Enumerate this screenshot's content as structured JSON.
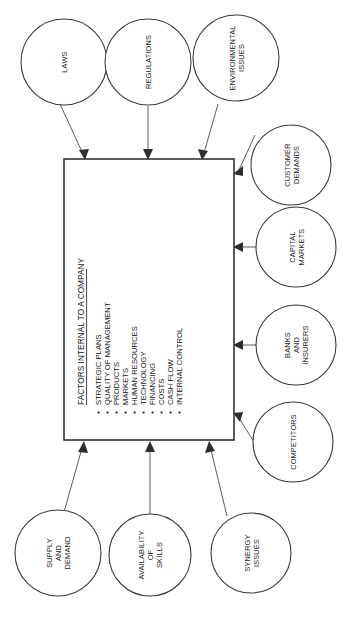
{
  "diagram": {
    "title": "Factors Internal to a Company",
    "orientation": "rotated-90-ccw",
    "center": {
      "heading": "FACTORS INTERNAL TO A COMPANY",
      "bullets": [
        "STRATEGIC PLANS",
        "QUALITY OF MANAGEMENT",
        "PRODUCTS",
        "MARKETS",
        "HUMAN RESOURCES",
        "TECHNOLOGY",
        "FINANCING",
        "COSTS",
        "CASH FLOW",
        "INTERNAL CONTROL"
      ],
      "bullet_glyph": "•"
    },
    "external_factors": [
      {
        "id": "laws",
        "lines": [
          "LAWS"
        ]
      },
      {
        "id": "regulations",
        "lines": [
          "REGULATIONS"
        ]
      },
      {
        "id": "environmental-issues",
        "lines": [
          "ENVIRONMENTAL",
          "ISSUES"
        ]
      },
      {
        "id": "customer-demands",
        "lines": [
          "CUSTOMER",
          "DEMANDS"
        ]
      },
      {
        "id": "capital-markets",
        "lines": [
          "CAPITAL",
          "MARKETS"
        ]
      },
      {
        "id": "banks-and-insurers",
        "lines": [
          "BANKS",
          "AND",
          "INSURERS"
        ]
      },
      {
        "id": "competitors",
        "lines": [
          "COMPETITORS"
        ]
      },
      {
        "id": "synergy-issues",
        "lines": [
          "SYNERGY",
          "ISSUES"
        ]
      },
      {
        "id": "availability-of-skills",
        "lines": [
          "AVAILABILITY",
          "OF",
          "SKILLS"
        ]
      },
      {
        "id": "supply-and-demand",
        "lines": [
          "SUPPLY",
          "AND",
          "DEMAND"
        ]
      }
    ],
    "colors": {
      "background": "#ffffff",
      "stroke": "#3a3a3a",
      "box_stroke": "#333333",
      "text": "#141414",
      "connector": "#4a4a4a"
    }
  }
}
